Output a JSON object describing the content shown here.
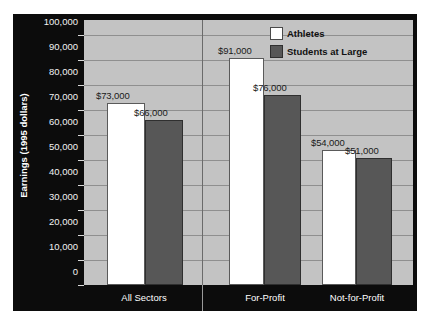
{
  "chart_data": {
    "type": "bar",
    "title": "",
    "xlabel": "",
    "ylabel": "Earnings (1995 dollars)",
    "categories": [
      "All Sectors",
      "For-Profit",
      "Not-for-Profit"
    ],
    "series": [
      {
        "name": "Athletes",
        "color": "#ffffff",
        "values": [
          73000,
          91000,
          54000
        ],
        "value_labels": [
          "$73,000",
          "$91,000",
          "$54,000"
        ]
      },
      {
        "name": "Students at Large",
        "color": "#575757",
        "values": [
          66000,
          76000,
          51000
        ],
        "value_labels": [
          "$66,000",
          "$76,000",
          "$51,000"
        ]
      }
    ],
    "ylim": [
      0,
      100000
    ],
    "ytick_labels": [
      "100,000",
      "90,000",
      "80,000",
      "70,000",
      "60,000",
      "50,000",
      "40,000",
      "30,000",
      "20,000",
      "10,000",
      "0"
    ],
    "ytick_values": [
      100000,
      90000,
      80000,
      70000,
      60000,
      50000,
      40000,
      30000,
      20000,
      10000,
      0
    ],
    "grid": true,
    "legend_position": "top-right",
    "group_separator": true,
    "plot_background": "#c3c3c3",
    "frame_background": "#0c0c0c"
  }
}
